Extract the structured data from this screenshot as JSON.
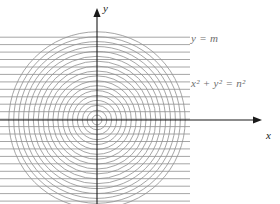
{
  "figure": {
    "kind": "math-diagram",
    "background_color": "#ffffff",
    "width": 280,
    "height": 204
  },
  "axes": {
    "x": {
      "label": "x",
      "color": "#1a1a1a",
      "y_pixel": 120,
      "x_start": 0,
      "x_end": 262,
      "arrow": "right"
    },
    "y": {
      "label": "y",
      "color": "#1a1a1a",
      "x_pixel": 97,
      "y_start": 204,
      "y_end": 8,
      "arrow": "up"
    },
    "origin": {
      "x": 97,
      "y": 120
    }
  },
  "annotations": {
    "horizontal_family_label": "y = m",
    "circle_family_label_prefix": "x",
    "circle_family_label": "x² + y² = n²",
    "label_color": "#6e6e6e"
  },
  "chart_data": {
    "type": "scatter",
    "title": "",
    "xlabel": "x",
    "ylabel": "y",
    "grid": false,
    "legend_position": "none",
    "series": [
      {
        "name": "y = m",
        "kind": "horizontal-lines",
        "color": "#8f8f8f",
        "line_width": 0.8,
        "x_extent_px": [
          0,
          190
        ],
        "count": 23,
        "spacing_px": 7.45,
        "first_y_px": 37.2,
        "y_values_px": [
          37.2,
          44.6,
          52.1,
          59.5,
          67.0,
          74.4,
          81.9,
          89.3,
          96.8,
          104.2,
          111.7,
          119.1,
          126.6,
          134.0,
          141.5,
          148.9,
          156.4,
          163.8,
          171.3,
          178.7,
          186.2,
          193.6,
          201.1
        ]
      },
      {
        "name": "x² + y² = n²",
        "kind": "concentric-circles",
        "color": "#8f8f8f",
        "line_width": 0.8,
        "center_px": [
          97,
          120
        ],
        "count": 18,
        "radius_step_px": 4.9,
        "radii_px": [
          4.9,
          9.8,
          14.7,
          19.6,
          24.5,
          29.4,
          34.3,
          39.2,
          44.1,
          49.0,
          53.9,
          58.8,
          63.7,
          68.6,
          73.5,
          78.4,
          83.3,
          88.2
        ]
      }
    ]
  }
}
